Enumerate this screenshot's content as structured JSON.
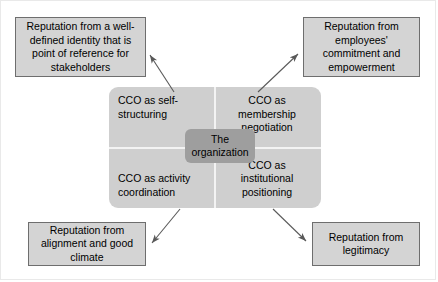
{
  "diagram": {
    "colors": {
      "box_fill": "#d4d4d4",
      "box_border": "#6e6e6e",
      "quadrant_fill": "#cfcfcf",
      "center_fill": "#9e9e9e",
      "divider": "#f3f3f3",
      "arrow": "#595959",
      "text": "#000000",
      "background": "#ffffff"
    },
    "center": {
      "line1": "The",
      "line2": "organization"
    },
    "quadrants": [
      {
        "id": "top-left",
        "line1": "CCO as self-",
        "line2": "structuring",
        "line3": ""
      },
      {
        "id": "top-right",
        "line1": "CCO as",
        "line2": "membership",
        "line3": "negotiation"
      },
      {
        "id": "bottom-left",
        "line1": "CCO as activity",
        "line2": "coordination",
        "line3": ""
      },
      {
        "id": "bottom-right",
        "line1": "CCO as",
        "line2": "institutional",
        "line3": "positioning"
      }
    ],
    "reputation_boxes": [
      {
        "id": "top-left",
        "line1": "Reputation from a well-",
        "line2": "defined identity that is",
        "line3": "point of reference for",
        "line4": "stakeholders"
      },
      {
        "id": "top-right",
        "line1": "Reputation from",
        "line2": "employees'",
        "line3": "commitment and",
        "line4": "empowerment"
      },
      {
        "id": "bottom-left",
        "line1": "Reputation from",
        "line2": "alignment and good",
        "line3": "climate",
        "line4": ""
      },
      {
        "id": "bottom-right",
        "line1": "Reputation from",
        "line2": "legitimacy",
        "line3": "",
        "line4": ""
      }
    ],
    "connectors": [
      {
        "id": "arrow-to-top-left",
        "from": "quadrant-top-left",
        "to": "reputation-top-left",
        "direction": "up-left"
      },
      {
        "id": "arrow-to-top-right",
        "from": "quadrant-top-right",
        "to": "reputation-top-right",
        "direction": "up-right"
      },
      {
        "id": "arrow-to-bottom-left",
        "from": "quadrant-bottom-left",
        "to": "reputation-bottom-left",
        "direction": "down-left"
      },
      {
        "id": "arrow-to-bottom-right",
        "from": "quadrant-bottom-right",
        "to": "reputation-bottom-right",
        "direction": "down-right"
      }
    ]
  }
}
